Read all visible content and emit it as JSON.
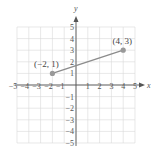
{
  "chart_data": {
    "type": "line",
    "title": "",
    "xlabel": "x",
    "ylabel": "y",
    "xlim": [
      -5,
      5
    ],
    "ylim": [
      -5,
      5
    ],
    "grid": true,
    "x_ticks": [
      "−5",
      "−4",
      "−3",
      "−2",
      "−1",
      "1",
      "2",
      "3",
      "4",
      "5"
    ],
    "y_ticks": [
      "5",
      "4",
      "3",
      "2",
      "1",
      "−1",
      "−2",
      "−3",
      "−4",
      "−5"
    ],
    "series": [
      {
        "name": "segment",
        "points": [
          {
            "x": -2,
            "y": 1,
            "label": "(−2, 1)"
          },
          {
            "x": 4,
            "y": 3,
            "label": "(4, 3)"
          }
        ]
      }
    ],
    "colors": {
      "grid": "#d9d9d9",
      "axis": "#555555",
      "segment": "#8c8c8c",
      "point": "#999999"
    }
  }
}
